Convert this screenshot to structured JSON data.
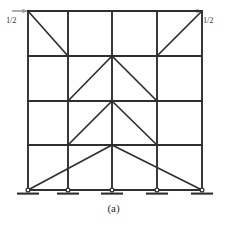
{
  "figure": {
    "caption": "(a)",
    "type": "structural-frame-diagram",
    "line_color": "#2f2f2f",
    "background_color": "#ffffff",
    "loads": [
      {
        "id": "left",
        "label": "1/2",
        "direction": "rightward",
        "applied_at": "roof-level-left-joint"
      },
      {
        "id": "right",
        "label": "1/2",
        "direction": "rightward",
        "applied_at": "roof-level-right-joint"
      }
    ],
    "geometry": {
      "column_x": [
        28,
        68,
        112,
        157,
        202
      ],
      "level_y": [
        11,
        56,
        101,
        145,
        190
      ],
      "stories": 4,
      "bays": 4,
      "support_count": 5,
      "support_type": "pinned"
    },
    "members": {
      "beams": [
        {
          "level": 0,
          "y": 11,
          "x1": 28,
          "x2": 202
        },
        {
          "level": 1,
          "y": 56,
          "x1": 28,
          "x2": 202
        },
        {
          "level": 2,
          "y": 101,
          "x1": 28,
          "x2": 202
        },
        {
          "level": 3,
          "y": 145,
          "x1": 28,
          "x2": 202
        },
        {
          "level": 4,
          "y": 190,
          "x1": 28,
          "x2": 202
        }
      ],
      "columns": [
        {
          "x": 28,
          "y1": 11,
          "y2": 190
        },
        {
          "x": 68,
          "y1": 11,
          "y2": 190
        },
        {
          "x": 112,
          "y1": 11,
          "y2": 190
        },
        {
          "x": 157,
          "y1": 11,
          "y2": 190
        },
        {
          "x": 202,
          "y1": 11,
          "y2": 190
        }
      ],
      "braces": [
        {
          "story": 1,
          "x1": 28,
          "y1": 11,
          "x2": 68,
          "y2": 56
        },
        {
          "story": 1,
          "x1": 202,
          "y1": 11,
          "x2": 157,
          "y2": 56
        },
        {
          "story": 2,
          "x1": 68,
          "y1": 101,
          "x2": 112,
          "y2": 56
        },
        {
          "story": 2,
          "x1": 157,
          "y1": 101,
          "x2": 112,
          "y2": 56
        },
        {
          "story": 3,
          "x1": 68,
          "y1": 145,
          "x2": 112,
          "y2": 101
        },
        {
          "story": 3,
          "x1": 157,
          "y1": 145,
          "x2": 112,
          "y2": 101
        },
        {
          "story": 4,
          "x1": 28,
          "y1": 190,
          "x2": 112,
          "y2": 145
        },
        {
          "story": 4,
          "x1": 202,
          "y1": 190,
          "x2": 112,
          "y2": 145
        }
      ],
      "supports": [
        {
          "x": 28,
          "y": 190
        },
        {
          "x": 68,
          "y": 190
        },
        {
          "x": 112,
          "y": 190
        },
        {
          "x": 157,
          "y": 190
        },
        {
          "x": 202,
          "y": 190
        }
      ]
    }
  }
}
